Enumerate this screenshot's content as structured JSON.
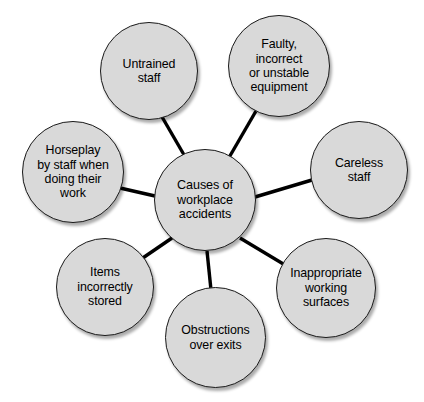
{
  "diagram": {
    "type": "radial-spider-diagram",
    "center": {
      "id": "causes-of-workplace-accidents",
      "label": "Causes of\nworkplace\naccidents"
    },
    "nodes": [
      {
        "id": "untrained-staff",
        "label": "Untrained\nstaff"
      },
      {
        "id": "faulty-equipment",
        "label": "Faulty,\nincorrect\nor unstable\nequipment"
      },
      {
        "id": "careless-staff",
        "label": "Careless\nstaff"
      },
      {
        "id": "inappropriate-surfaces",
        "label": "Inappropriate\nworking\nsurfaces"
      },
      {
        "id": "obstructions-over-exits",
        "label": "Obstructions\nover exits"
      },
      {
        "id": "items-incorrectly-stored",
        "label": "Items\nincorrectly\nstored"
      },
      {
        "id": "horseplay-by-staff",
        "label": "Horseplay\nby staff when\ndoing their\nwork"
      }
    ],
    "edges": [
      {
        "from": "causes-of-workplace-accidents",
        "to": "untrained-staff"
      },
      {
        "from": "causes-of-workplace-accidents",
        "to": "faulty-equipment"
      },
      {
        "from": "causes-of-workplace-accidents",
        "to": "careless-staff"
      },
      {
        "from": "causes-of-workplace-accidents",
        "to": "inappropriate-surfaces"
      },
      {
        "from": "causes-of-workplace-accidents",
        "to": "obstructions-over-exits"
      },
      {
        "from": "causes-of-workplace-accidents",
        "to": "items-incorrectly-stored"
      },
      {
        "from": "causes-of-workplace-accidents",
        "to": "horseplay-by-staff"
      }
    ],
    "colors": {
      "node_fill": "#d9d9d9",
      "node_stroke": "#1a1a1a",
      "edge_stroke": "#000000",
      "text": "#000000",
      "background": "#ffffff"
    }
  }
}
